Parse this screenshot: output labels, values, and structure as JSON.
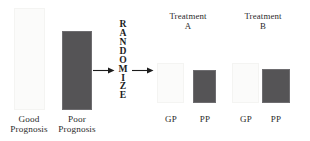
{
  "diagram": {
    "randomize_label": "RANDOMIZE",
    "randomize_letters": [
      "R",
      "A",
      "N",
      "D",
      "O",
      "M",
      "I",
      "Z",
      "E"
    ],
    "colors": {
      "dark_bar": "#555456",
      "dark_bar_border": "#6e6d70",
      "light_bar": "#fbfbfa",
      "light_bar_border": "#f4f4f2",
      "text": "#2b2b2b",
      "background": "#ffffff",
      "arrow": "#1c1c1c"
    },
    "groups": [
      {
        "name": "pre-randomization",
        "bars": [
          {
            "id": "good-prognosis",
            "label": "Good\nPrognosis",
            "shade": "light",
            "value": 102
          },
          {
            "id": "poor-prognosis",
            "label": "Poor\nPrognosis",
            "shade": "dark",
            "value": 79
          }
        ]
      },
      {
        "name": "treatment-a",
        "heading": "Treatment\nA",
        "bars": [
          {
            "id": "treatment-a-gp",
            "label": "GP",
            "shade": "light",
            "value": 40
          },
          {
            "id": "treatment-a-pp",
            "label": "PP",
            "shade": "dark",
            "value": 33
          }
        ]
      },
      {
        "name": "treatment-b",
        "heading": "Treatment\nB",
        "bars": [
          {
            "id": "treatment-b-gp",
            "label": "GP",
            "shade": "light",
            "value": 40
          },
          {
            "id": "treatment-b-pp",
            "label": "PP",
            "shade": "dark",
            "value": 34
          }
        ]
      }
    ],
    "arrows": [
      {
        "id": "arrow-into-randomize",
        "direction": "right"
      },
      {
        "id": "arrow-out-of-randomize",
        "direction": "right"
      }
    ]
  }
}
